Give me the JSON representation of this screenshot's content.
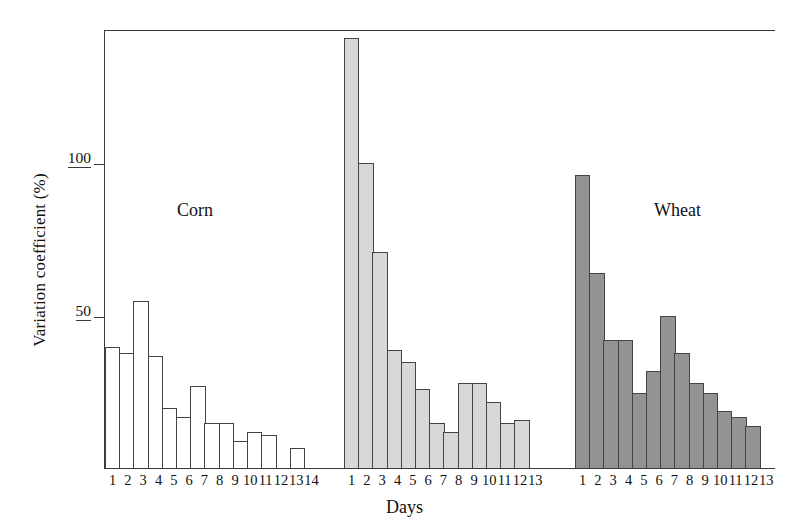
{
  "chart_data": {
    "type": "bar",
    "title": "",
    "xlabel": "Days",
    "ylabel": "Variation coefficient (%)",
    "ylim": [
      0,
      143
    ],
    "xlim_note": "three independent day-series, one per crop group",
    "grid": false,
    "legend": "inline group labels",
    "y_ticks": [
      {
        "value": 50,
        "label": "50"
      },
      {
        "value": 100,
        "label": "100"
      }
    ],
    "groups": [
      {
        "name": "Corn",
        "label": "Corn",
        "fill": "#ffffff",
        "stroke": "#444444",
        "categories": [
          "1",
          "2",
          "3",
          "4",
          "5",
          "6",
          "7",
          "8",
          "9",
          "10",
          "11",
          "12",
          "13",
          "14"
        ],
        "values": [
          40,
          38,
          55,
          37,
          20,
          17,
          27,
          15,
          15,
          9,
          12,
          11,
          0,
          7
        ]
      },
      {
        "name": "Wheat",
        "label": "Wheat",
        "fill": "#d8d8d8",
        "stroke": "#444444",
        "categories": [
          "1",
          "2",
          "3",
          "4",
          "5",
          "6",
          "7",
          "8",
          "9",
          "10",
          "11",
          "12",
          "13"
        ],
        "values": [
          141,
          100,
          71,
          39,
          35,
          26,
          15,
          12,
          28,
          28,
          22,
          15,
          16
        ]
      },
      {
        "name": "Sorghum",
        "label": "Sorghum",
        "fill": "#939393",
        "stroke": "#444444",
        "categories": [
          "1",
          "2",
          "3",
          "4",
          "5",
          "6",
          "7",
          "8",
          "9",
          "10",
          "11",
          "12",
          "13"
        ],
        "values": [
          96,
          64,
          42,
          42,
          25,
          32,
          50,
          38,
          28,
          25,
          19,
          17,
          14
        ]
      }
    ]
  },
  "axes": {
    "y_label": "Variation coefficient (%)",
    "x_label": "Days",
    "y_tick_100": "100",
    "y_tick_50": "50"
  },
  "labels": {
    "corn": "Corn",
    "wheat": "Wheat",
    "sorghum": "Sorghum"
  },
  "colors": {
    "axis": "#3a3a3a",
    "bar_stroke": "#444444",
    "corn_fill": "#ffffff",
    "wheat_fill": "#d8d8d8",
    "sorghum_fill": "#939393",
    "background": "#ffffff"
  }
}
